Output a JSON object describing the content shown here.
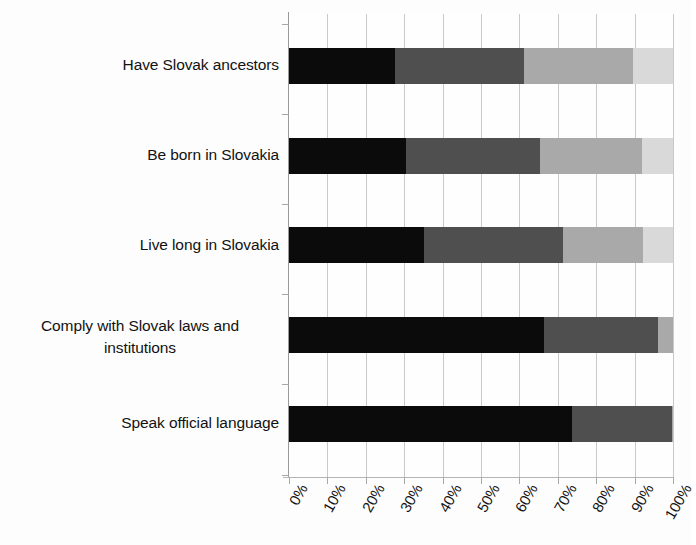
{
  "chart_data": {
    "type": "bar",
    "orientation": "horizontal",
    "stacked": true,
    "normalized_percent": true,
    "title": "",
    "subtitle": "",
    "xlabel": "",
    "ylabel": "",
    "xlim": [
      0,
      100
    ],
    "grid": true,
    "legend": "none",
    "categories": [
      "Have Slovak ancestors",
      "Be born in Slovakia",
      "Live long in Slovakia",
      "Comply with Slovak laws and\ninstitutions",
      "Speak official language"
    ],
    "xticklabels": [
      "0%",
      "10%",
      "20%",
      "30%",
      "40%",
      "50%",
      "60%",
      "70%",
      "80%",
      "90%",
      "100%"
    ],
    "xtickvalues": [
      0,
      10,
      20,
      30,
      40,
      50,
      60,
      70,
      80,
      90,
      100
    ],
    "series": [
      {
        "name": "series-1",
        "color": "#0b0b0b",
        "values": [
          27.6,
          30.5,
          35.2,
          66.4,
          73.7
        ]
      },
      {
        "name": "series-2",
        "color": "#4f4f4f",
        "values": [
          33.6,
          34.9,
          36.1,
          29.6,
          26.0
        ]
      },
      {
        "name": "series-3",
        "color": "#a9a9a9",
        "values": [
          28.4,
          26.6,
          20.9,
          4.0,
          0.3
        ]
      },
      {
        "name": "series-4",
        "color": "#d9d9d9",
        "values": [
          10.4,
          8.0,
          7.8,
          0.0,
          0.0
        ]
      }
    ]
  },
  "colors": {
    "segment_1": "#0b0b0b",
    "segment_2": "#4f4f4f",
    "segment_3": "#a9a9a9",
    "segment_4": "#d9d9d9",
    "gridline": "#c9c9c9",
    "axis": "#9a9a9a",
    "background": "#fdfdfd",
    "text": "#121212"
  }
}
